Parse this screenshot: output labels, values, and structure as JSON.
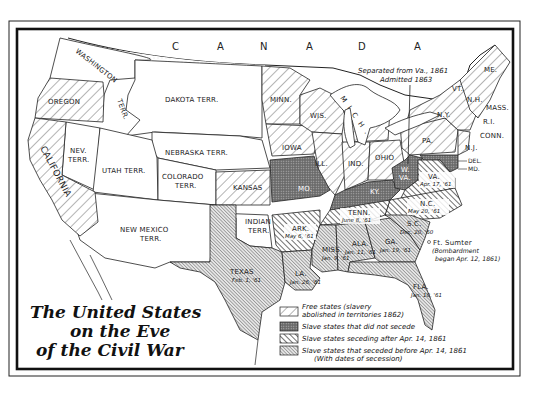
{
  "map": {
    "title_lines": [
      "The United States",
      "on the Eve",
      "of the Civil War"
    ],
    "country_label": [
      "C",
      "A",
      "N",
      "A",
      "D",
      "A"
    ],
    "annotation": {
      "wva_note_line1": "Separated from Va., 1861",
      "wva_note_line2": "Admitted 1863",
      "sumter_label": "Ft. Sumter",
      "sumter_note_line1": "(Bombardment",
      "sumter_note_line2": "began Apr. 12, 1861)"
    },
    "territories": {
      "washington": "WASHINGTON",
      "washington2": "TERR.",
      "dakota": "DAKOTA  TERR.",
      "nebraska": "NEBRASKA  TERR.",
      "nevada1": "NEV.",
      "nevada2": "TERR.",
      "utah": "UTAH TERR.",
      "colorado1": "COLORADO",
      "colorado2": "TERR.",
      "newmexico1": "NEW MEXICO",
      "newmexico2": "TERR.",
      "indian1": "INDIAN",
      "indian2": "TERR."
    },
    "free_states": {
      "oregon": "OREGON",
      "california": "CALIFORNIA",
      "kansas": "KANSAS",
      "minn": "MINN.",
      "iowa": "IOWA",
      "wis": "WIS.",
      "mich": "MICH.",
      "ill": "ILL.",
      "ind": "IND.",
      "ohio": "OHIO",
      "pa": "PA.",
      "ny": "N.Y.",
      "vt": "VT.",
      "nh": "N.H.",
      "me": "ME.",
      "mass": "MASS.",
      "ri": "R.I.",
      "conn": "CONN.",
      "nj": "N.J."
    },
    "border_states": {
      "mo": "MO.",
      "ky": "KY.",
      "wva1": "W.",
      "wva2": "VA.",
      "del": "DEL.",
      "md": "MD."
    },
    "seceded_after": {
      "va": "VA.",
      "va_date": "Apr. 17, '61",
      "nc": "N.C.",
      "nc_date": "May 20, '61",
      "tenn": "TENN.",
      "tenn_date": "June 8, '61",
      "ark": "ARK.",
      "ark_date": "May 6, '61"
    },
    "seceded_before": {
      "sc": "S.C.",
      "sc_date": "Dec. 20, '60",
      "ga": "GA.",
      "ga_date": "Jan. 19, '61",
      "ala": "ALA.",
      "ala_date": "Jan. 11, '61",
      "miss": "MISS.",
      "miss_date": "Jan. 9, '61",
      "fla": "FLA.",
      "fla_date": "Jan. 10, '61",
      "la": "LA.",
      "la_date": "Jan. 26, '61",
      "texas": "TEXAS",
      "texas_date": "Feb. 1, '61"
    },
    "legend": [
      {
        "key": "free",
        "line1": "Free states  (slavery",
        "line2": "abolished in territories 1862)"
      },
      {
        "key": "border",
        "line1": "Slave states that did not secede"
      },
      {
        "key": "after",
        "line1": "Slave states seceding after Apr. 14, 1861"
      },
      {
        "key": "before",
        "line1": "Slave states that seceded before Apr. 14, 1861",
        "line2": "(With dates of secession)"
      }
    ],
    "colors": {
      "ink": "#222222",
      "paper": "#ffffff",
      "border_fill": "#7a7a7a",
      "before_fill": "#bdbdbd"
    }
  }
}
